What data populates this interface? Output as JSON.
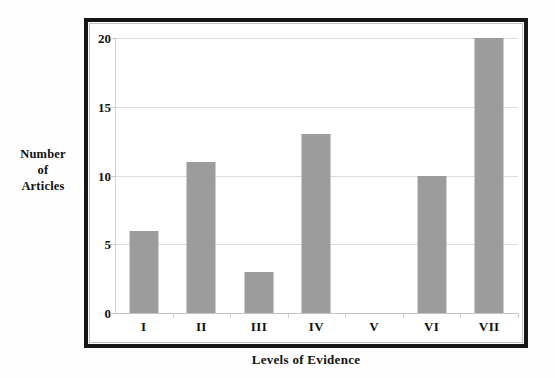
{
  "chart_data": {
    "type": "bar",
    "title": "",
    "categories": [
      "I",
      "II",
      "III",
      "IV",
      "V",
      "VI",
      "VII"
    ],
    "values": [
      6,
      11,
      3,
      13,
      0,
      10,
      20
    ],
    "xlabel": "Levels of Evidence",
    "ylabel": "Number of Articles",
    "ylabel_lines": [
      "Number",
      "of",
      "Articles"
    ],
    "ylim": [
      0,
      20
    ],
    "yticks": [
      0,
      5,
      10,
      15,
      20
    ],
    "ytick_labels": [
      "0",
      "5",
      "10",
      "15",
      "20"
    ],
    "grid": true,
    "grid_axis": "y",
    "legend": null,
    "bar_color": "#9c9c9c",
    "grid_color": "#dcdcdc",
    "frame_color": "#161616",
    "background_color": "#ffffff"
  }
}
